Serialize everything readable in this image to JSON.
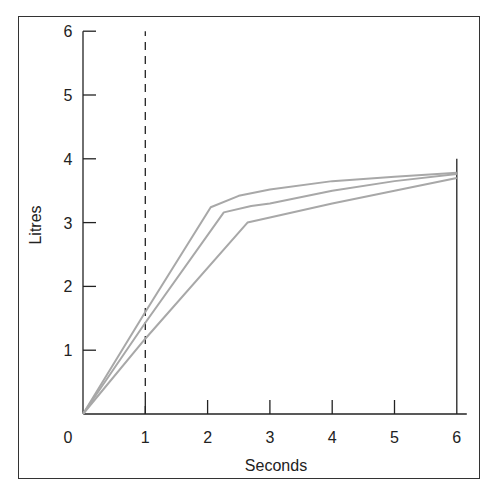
{
  "chart_data": {
    "type": "line",
    "title": "",
    "xlabel": "Seconds",
    "ylabel": "Litres",
    "xlim": [
      0,
      6
    ],
    "ylim": [
      0,
      6
    ],
    "x_ticks": [
      "0",
      "1",
      "2",
      "3",
      "4",
      "5",
      "6"
    ],
    "y_ticks": [
      "1",
      "2",
      "3",
      "4",
      "5",
      "6"
    ],
    "grid": false,
    "legend": null,
    "annotations": [
      {
        "type": "vertical-dashed-line",
        "x": 1,
        "from": 0,
        "to": 6
      },
      {
        "type": "vertical-solid-line",
        "x": 6,
        "from": 0,
        "to": 4
      }
    ],
    "series": [
      {
        "name": "curve-1",
        "points": [
          [
            0,
            0
          ],
          [
            1,
            1.6
          ],
          [
            2.05,
            3.24
          ],
          [
            2.5,
            3.42
          ],
          [
            3,
            3.52
          ],
          [
            4,
            3.65
          ],
          [
            5,
            3.72
          ],
          [
            6,
            3.78
          ]
        ]
      },
      {
        "name": "curve-2",
        "points": [
          [
            0,
            0
          ],
          [
            1,
            1.43
          ],
          [
            2.26,
            3.16
          ],
          [
            2.7,
            3.26
          ],
          [
            3,
            3.3
          ],
          [
            4,
            3.5
          ],
          [
            5,
            3.65
          ],
          [
            6,
            3.76
          ]
        ]
      },
      {
        "name": "curve-3",
        "points": [
          [
            0,
            0
          ],
          [
            1,
            1.18
          ],
          [
            2.64,
            3.0
          ],
          [
            3,
            3.08
          ],
          [
            4,
            3.3
          ],
          [
            5,
            3.5
          ],
          [
            6,
            3.7
          ]
        ]
      }
    ],
    "colors": {
      "curves": "#a8a8a8",
      "axes": "#222222",
      "frame": "#333333"
    }
  }
}
